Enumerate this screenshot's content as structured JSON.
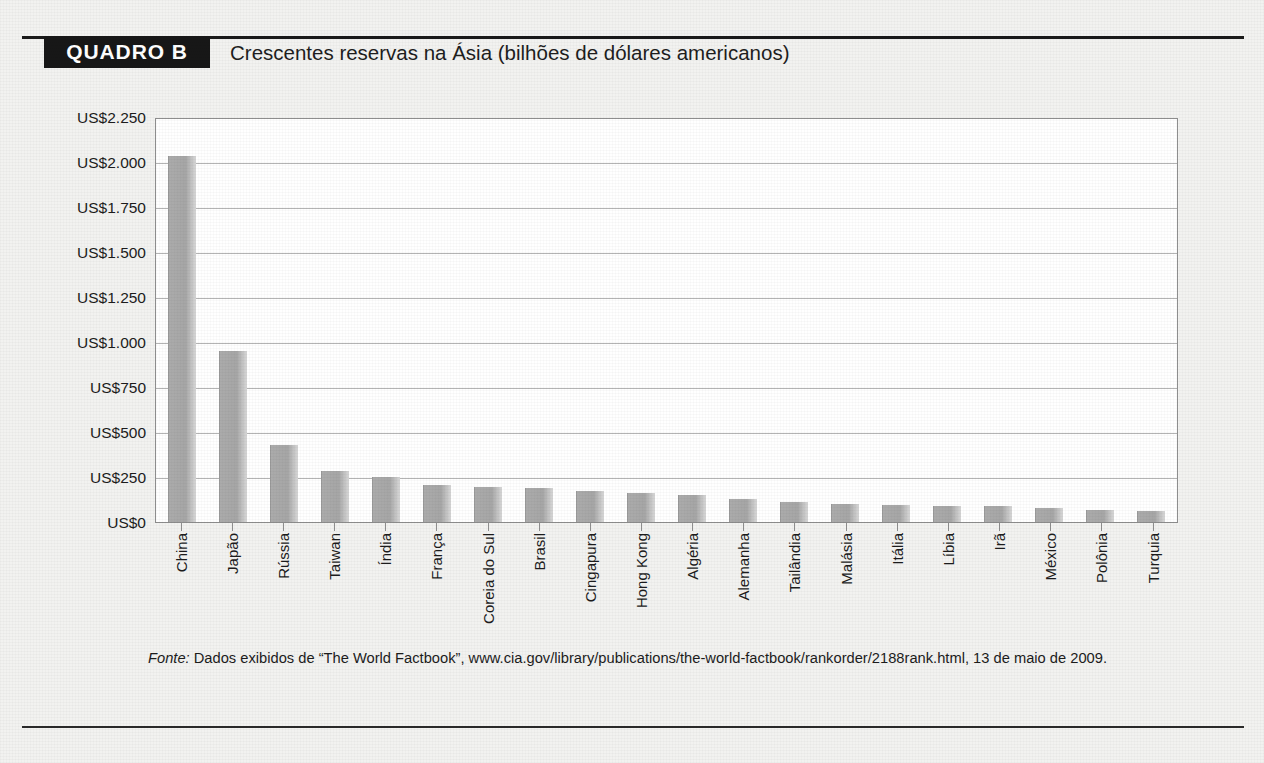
{
  "header": {
    "badge_label": "QUADRO B",
    "title": "Crescentes reservas na Ásia (bilhões de dólares americanos)"
  },
  "source": {
    "label": "Fonte:",
    "text": " Dados exibidos de “The World Factbook”, www.cia.gov/library/publications/the-world-factbook/rankorder/2188rank.html, 13 de maio de 2009."
  },
  "chart_data": {
    "type": "bar",
    "title": "Crescentes reservas na Ásia (bilhões de dólares americanos)",
    "xlabel": "",
    "ylabel": "",
    "ylim": [
      0,
      2250
    ],
    "grid": true,
    "legend": "none",
    "y_ticks": [
      0,
      250,
      500,
      750,
      1000,
      1250,
      1500,
      1750,
      2000,
      2250
    ],
    "y_tick_labels": [
      "US$0",
      "US$250",
      "US$500",
      "US$750",
      "US$1.000",
      "US$1.250",
      "US$1.500",
      "US$1.750",
      "US$2.000",
      "US$2.250"
    ],
    "categories": [
      "China",
      "Japão",
      "Rússia",
      "Taiwan",
      "Índia",
      "França",
      "Coreia do Sul",
      "Brasil",
      "Cingapura",
      "Hong Kong",
      "Algéria",
      "Alemanha",
      "Tailândia",
      "Malásia",
      "Itália",
      "Líbia",
      "Irã",
      "México",
      "Polônia",
      "Turquia"
    ],
    "values": [
      2033,
      950,
      430,
      285,
      250,
      205,
      195,
      190,
      175,
      160,
      150,
      130,
      110,
      100,
      95,
      90,
      88,
      80,
      65,
      62
    ],
    "bar_color": "#a8a8a8",
    "plot_background": "#ffffff"
  }
}
